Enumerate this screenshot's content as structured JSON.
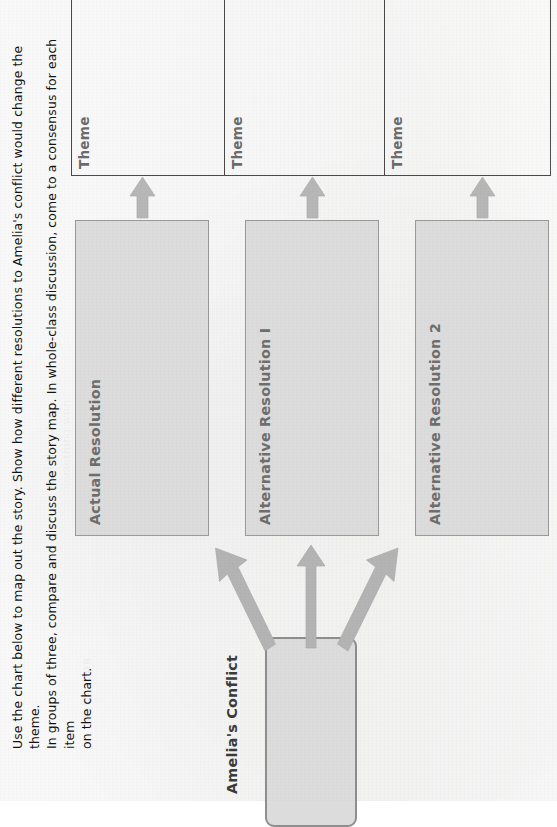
{
  "document": {
    "type": "worksheet-story-map",
    "orientation": "rotated-90-ccw",
    "background_color": "#fafafa"
  },
  "instructions": {
    "text": "Use the chart below to map out the story. Show how different resolutions to Amelia's conflict would change the theme.\nIn groups of three, compare and discuss the story map.  In whole-class discussion, come to a consensus for each item\non the chart."
  },
  "theme_row": {
    "cells": [
      {
        "label": "Theme",
        "value": ""
      },
      {
        "label": "Theme",
        "value": ""
      },
      {
        "label": "Theme",
        "value": ""
      }
    ],
    "border_color": "#4a4a4a",
    "label_color": "#6b6b6b",
    "fill_color": "#ffffff"
  },
  "resolutions": {
    "boxes": [
      {
        "label": "Actual Resolution",
        "value": ""
      },
      {
        "label": "Alternative Resolution I",
        "value": ""
      },
      {
        "label": "Alternative Resolution 2",
        "value": ""
      }
    ],
    "fill_color": "#dcdcdc",
    "border_color": "#9a9a9a",
    "label_color": "#6e6e6e"
  },
  "conflict": {
    "label": "Amelia's Conflict",
    "value": "",
    "fill_color": "#dcdcdc",
    "border_color": "#8e8e8e",
    "label_color": "#3b3b3b"
  },
  "arrows": {
    "color": "#b4b4b4",
    "stroke_color": "#a8a8a8",
    "from_conflict": [
      {
        "name": "conflict-to-actual-resolution",
        "direction": "up-left"
      },
      {
        "name": "conflict-to-alternative-resolution-1",
        "direction": "up"
      },
      {
        "name": "conflict-to-alternative-resolution-2",
        "direction": "up-right"
      }
    ],
    "to_theme": [
      {
        "name": "actual-resolution-to-theme-1",
        "direction": "up"
      },
      {
        "name": "alternative-resolution-1-to-theme-2",
        "direction": "up"
      },
      {
        "name": "alternative-resolution-2-to-theme-3",
        "direction": "up"
      }
    ]
  },
  "bleed_through": {
    "a": "that the whole\nsomething with\nfrom the writer\nabout the entire\nstory itself",
    "b": "of the resolution\nin this passage\nabout how the\nsituation ends",
    "c": "read carefully\nwhat the author\nis trying to say\nin the final lines",
    "d": "Reflection"
  }
}
